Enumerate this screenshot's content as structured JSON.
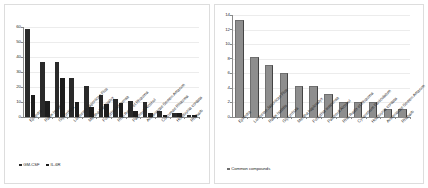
{
  "figure": {
    "background": "#ffffff",
    "panel_border_color": "#dddddd"
  },
  "chart_data": [
    {
      "id": "left",
      "type": "bar",
      "title": "",
      "xlabel": "",
      "ylabel": "",
      "ylim": [
        0,
        60
      ],
      "yticks": [
        0,
        10,
        20,
        30,
        40,
        50,
        60
      ],
      "grid": true,
      "legend_position": "bottom-left",
      "categories": [
        "Ephedra",
        "Radix Isatidis",
        "Glycyrrhiza",
        "Lonicerae Japonicae Flos",
        "Mentha haplocalyx",
        "Forsythia suspensa",
        "Rhei Radix et Rhizoma",
        "Patchouli Alcohol",
        "Armeniacae Semen Amarum",
        "Curcumae Rhizoma",
        "Houttuynia cordata",
        "Rhubarb"
      ],
      "series": [
        {
          "name": "GM-CSF",
          "color": "#2a2a2a",
          "values": [
            59,
            37,
            37,
            26,
            21,
            15,
            12,
            11,
            10,
            4,
            3,
            1.5
          ]
        },
        {
          "name": "IL-6R",
          "color": "#1d1d1d",
          "values": [
            15,
            11,
            26,
            10,
            7,
            9,
            9.5,
            4,
            3,
            1.5,
            3,
            1.2
          ]
        }
      ]
    },
    {
      "id": "right",
      "type": "bar",
      "title": "",
      "xlabel": "",
      "ylabel": "",
      "ylim": [
        0,
        14
      ],
      "yticks": [
        0,
        2,
        4,
        6,
        8,
        10,
        12,
        14
      ],
      "grid": true,
      "legend_position": "bottom-left",
      "categories": [
        "Ephedra",
        "Lonicerae Japonicae Flos",
        "Radix Isatidis",
        "Glycyrrhiza",
        "Mentha haplocalyx",
        "Forsythia suspensa",
        "Patchouli Alcohol",
        "Rhei Radix et Rhizoma",
        "Cynanchum Paniculatum",
        "Houttuynia cordata",
        "Armeniacae Semen Amarum",
        "Rhubarb"
      ],
      "series": [
        {
          "name": "Common compounds",
          "color": "#8e8e8e",
          "values": [
            13.3,
            8.2,
            7.2,
            6.1,
            4.2,
            4.2,
            3.2,
            2.1,
            2.1,
            2.1,
            1.1,
            1.1
          ]
        }
      ]
    }
  ]
}
